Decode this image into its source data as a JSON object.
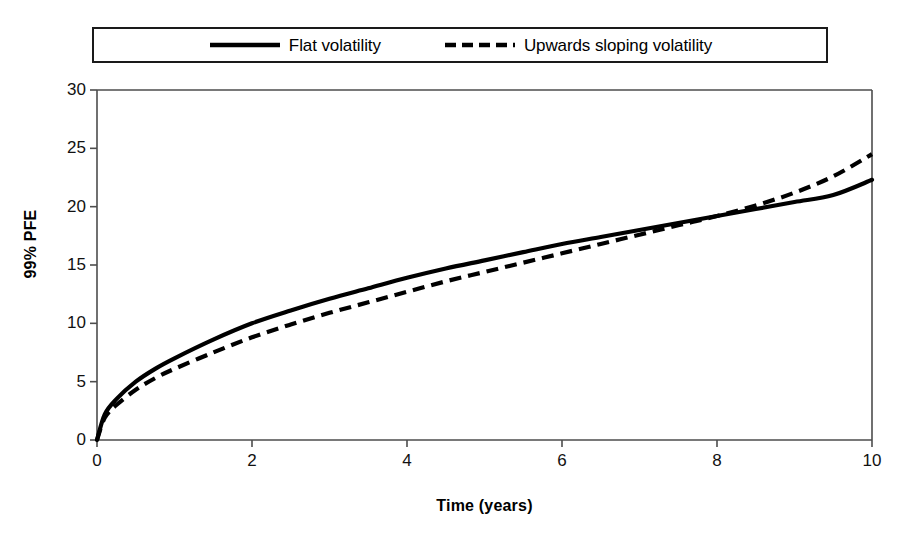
{
  "chart_data": {
    "type": "line",
    "title": "",
    "xlabel": "Time (years)",
    "ylabel": "99% PFE",
    "xlim": [
      0,
      10
    ],
    "ylim": [
      0,
      30
    ],
    "xticks": [
      0,
      2,
      4,
      6,
      8,
      10
    ],
    "yticks": [
      0,
      5,
      10,
      15,
      20,
      25,
      30
    ],
    "xtick_labels": [
      "0",
      "2",
      "4",
      "6",
      "8",
      "10"
    ],
    "ytick_labels": [
      "0",
      "5",
      "10",
      "15",
      "20",
      "25",
      "30"
    ],
    "grid": false,
    "legend_position": "top",
    "x": [
      0,
      0.1,
      0.25,
      0.5,
      0.75,
      1,
      1.5,
      2,
      2.5,
      3,
      3.5,
      4,
      4.5,
      5,
      5.5,
      6,
      6.5,
      7,
      7.5,
      8,
      8.5,
      9,
      9.5,
      10
    ],
    "series": [
      {
        "name": "Flat volatility",
        "style": "solid",
        "color": "#000000",
        "values": [
          0,
          2.2,
          3.5,
          5.0,
          6.1,
          7.0,
          8.6,
          10.0,
          11.1,
          12.1,
          13.0,
          13.9,
          14.7,
          15.4,
          16.1,
          16.8,
          17.4,
          18.0,
          18.6,
          19.2,
          19.8,
          20.4,
          21.0,
          22.3
        ]
      },
      {
        "name": "Upwards sloping volatility",
        "style": "dashed",
        "color": "#000000",
        "values": [
          0,
          1.9,
          3.0,
          4.3,
          5.3,
          6.1,
          7.5,
          8.8,
          9.9,
          10.9,
          11.8,
          12.7,
          13.6,
          14.4,
          15.2,
          16.0,
          16.8,
          17.6,
          18.4,
          19.2,
          20.1,
          21.2,
          22.6,
          24.5
        ]
      }
    ]
  },
  "legend": {
    "entries": [
      {
        "label": "Flat volatility",
        "style": "solid"
      },
      {
        "label": "Upwards sloping volatility",
        "style": "dashed"
      }
    ]
  },
  "axes": {
    "x_title": "Time (years)",
    "y_title": "99% PFE"
  },
  "colors": {
    "line": "#000000",
    "frame": "#4d4d4d",
    "background": "#ffffff"
  }
}
